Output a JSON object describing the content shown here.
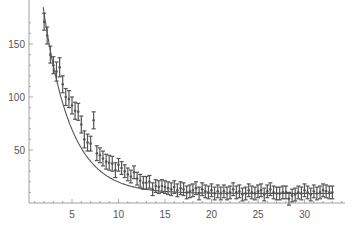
{
  "chart_data": {
    "type": "scatter",
    "title": "",
    "xlabel": "",
    "ylabel": "",
    "xlim": [
      0.5,
      34.5
    ],
    "ylim": [
      -3,
      180
    ],
    "grid": false,
    "legend": null,
    "x_ticks": [
      5,
      10,
      15,
      20,
      25,
      30
    ],
    "y_ticks": [
      50,
      100,
      150
    ],
    "error_bars": true,
    "fit_line": true,
    "series": [
      {
        "name": "data",
        "color": "#555555",
        "points": [
          [
            2.0,
            171,
            8
          ],
          [
            2.33,
            158,
            8
          ],
          [
            2.67,
            140,
            8
          ],
          [
            3.0,
            130,
            8
          ],
          [
            3.33,
            124,
            9
          ],
          [
            3.67,
            128,
            9
          ],
          [
            4.0,
            112,
            8
          ],
          [
            4.33,
            100,
            8
          ],
          [
            4.67,
            98,
            8
          ],
          [
            5.0,
            92,
            8
          ],
          [
            5.33,
            87,
            8
          ],
          [
            5.67,
            86,
            8
          ],
          [
            6.0,
            74,
            8
          ],
          [
            6.33,
            60,
            8
          ],
          [
            6.67,
            57,
            8
          ],
          [
            7.0,
            56,
            7
          ],
          [
            7.33,
            78,
            8
          ],
          [
            7.67,
            47,
            7
          ],
          [
            8.0,
            45,
            7
          ],
          [
            8.33,
            42,
            7
          ],
          [
            8.67,
            39,
            7
          ],
          [
            9.0,
            38,
            7
          ],
          [
            9.33,
            37,
            7
          ],
          [
            9.67,
            31,
            7
          ],
          [
            10.0,
            36,
            6
          ],
          [
            10.33,
            33,
            6
          ],
          [
            10.67,
            30,
            6
          ],
          [
            11.0,
            27,
            6
          ],
          [
            11.33,
            25,
            6
          ],
          [
            11.67,
            29,
            6
          ],
          [
            12.0,
            23,
            6
          ],
          [
            12.33,
            21,
            6
          ],
          [
            12.67,
            19,
            6
          ],
          [
            13.0,
            19,
            6
          ],
          [
            13.33,
            20,
            6
          ],
          [
            13.67,
            13,
            6
          ],
          [
            14.0,
            16,
            6
          ],
          [
            14.33,
            15,
            6
          ],
          [
            14.67,
            16,
            6
          ],
          [
            15.0,
            15,
            6
          ],
          [
            15.33,
            14,
            6
          ],
          [
            15.67,
            13,
            6
          ],
          [
            16.0,
            15,
            6
          ],
          [
            16.33,
            12,
            6
          ],
          [
            16.67,
            14,
            6
          ],
          [
            17.0,
            13,
            6
          ],
          [
            17.33,
            10,
            6
          ],
          [
            17.67,
            11,
            6
          ],
          [
            18.0,
            12,
            6
          ],
          [
            18.33,
            14,
            6
          ],
          [
            18.67,
            9,
            6
          ],
          [
            19.0,
            13,
            6
          ],
          [
            19.33,
            11,
            6
          ],
          [
            19.67,
            10,
            6
          ],
          [
            20.0,
            12,
            6
          ],
          [
            20.33,
            9,
            6
          ],
          [
            20.67,
            11,
            6
          ],
          [
            21.0,
            9,
            6
          ],
          [
            21.33,
            11,
            6
          ],
          [
            21.67,
            9,
            6
          ],
          [
            22.0,
            10,
            6
          ],
          [
            22.33,
            13,
            6
          ],
          [
            22.67,
            10,
            6
          ],
          [
            23.0,
            11,
            6
          ],
          [
            23.33,
            8,
            6
          ],
          [
            23.67,
            9,
            6
          ],
          [
            24.0,
            12,
            6
          ],
          [
            24.33,
            10,
            6
          ],
          [
            24.67,
            9,
            6
          ],
          [
            25.0,
            11,
            6
          ],
          [
            25.33,
            12,
            6
          ],
          [
            25.67,
            8,
            6
          ],
          [
            26.0,
            11,
            6
          ],
          [
            26.33,
            13,
            6
          ],
          [
            26.67,
            10,
            6
          ],
          [
            27.0,
            9,
            6
          ],
          [
            27.33,
            9,
            6
          ],
          [
            27.67,
            10,
            6
          ],
          [
            28.0,
            10,
            6
          ],
          [
            28.33,
            4,
            6
          ],
          [
            28.67,
            7,
            6
          ],
          [
            29.0,
            8,
            6
          ],
          [
            29.33,
            10,
            6
          ],
          [
            29.67,
            9,
            6
          ],
          [
            30.0,
            12,
            6
          ],
          [
            30.33,
            10,
            6
          ],
          [
            30.67,
            8,
            6
          ],
          [
            31.0,
            11,
            6
          ],
          [
            31.33,
            9,
            6
          ],
          [
            31.67,
            10,
            6
          ],
          [
            32.0,
            12,
            6
          ],
          [
            32.33,
            11,
            6
          ],
          [
            32.67,
            10,
            6
          ],
          [
            33.0,
            10,
            6
          ]
        ]
      }
    ],
    "fit": {
      "model": "a*exp(-(x-x0)/tau)+c",
      "a": 195,
      "x0": 1.6,
      "tau": 2.9,
      "c": 9
    }
  },
  "axes": {
    "color": "#888888",
    "tick_label_color": "#555555"
  }
}
